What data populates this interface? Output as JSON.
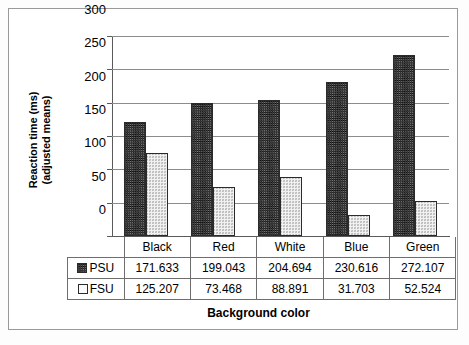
{
  "chart_data": {
    "type": "bar",
    "title": "",
    "xlabel": "Background color",
    "ylabel": "Reaction time (ms) (adjusted means)",
    "ylabel_lines": [
      "Reaction time (ms)",
      "(adjusted means)"
    ],
    "categories": [
      "Black",
      "Red",
      "White",
      "Blue",
      "Green"
    ],
    "series": [
      {
        "name": "PSU",
        "values": [
          171.633,
          199.043,
          204.694,
          230.616,
          272.107
        ],
        "labels": [
          "171.633",
          "199.043",
          "204.694",
          "230.616",
          "272.107"
        ],
        "fill": "dark-crosshatch",
        "color": "#7d7d7d"
      },
      {
        "name": "FSU",
        "values": [
          125.207,
          73.468,
          88.891,
          31.703,
          52.524
        ],
        "labels": [
          "125.207",
          "73.468",
          "88.891",
          "31.703",
          "52.524"
        ],
        "fill": "light-stipple",
        "color": "#f1f1f1"
      }
    ],
    "ylim": [
      0,
      300
    ],
    "yticks": [
      0,
      50,
      100,
      150,
      200,
      250,
      300
    ],
    "ytick_labels": [
      "0",
      "50",
      "100",
      "150",
      "200",
      "250",
      "300"
    ],
    "grid": true,
    "legend_position": "data-table-below"
  }
}
